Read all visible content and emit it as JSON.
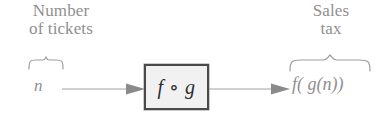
{
  "diagram": {
    "colors": {
      "label_gray": "#8f8f8f",
      "box_border": "#4a4a4a",
      "box_fill": "#f1f1f1",
      "box_text": "#2e2e2e",
      "arrow": "#9a9a9a",
      "brace": "#9e9e9e",
      "background": "#ffffff"
    },
    "input": {
      "label_line1": "Number",
      "label_line2": "of tickets",
      "variable": "n",
      "brace": "overbrace",
      "arrow": "right-arrow"
    },
    "process": {
      "box_label": "f ∘ g",
      "shape": "rectangle"
    },
    "output": {
      "label_line1": "Sales",
      "label_line2": "tax",
      "expression": "f( g(n))",
      "brace": "overbrace",
      "arrow": "right-arrow"
    }
  }
}
